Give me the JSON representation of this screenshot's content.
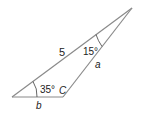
{
  "diagram": {
    "type": "triangle",
    "vertices": {
      "A": {
        "x": 12,
        "y": 97
      },
      "C": {
        "x": 63,
        "y": 97
      },
      "B": {
        "x": 132,
        "y": 8
      }
    },
    "labels": {
      "side_hyp": "5",
      "angle_top": "15°",
      "side_a": "a",
      "angle_left": "35°",
      "vertex_c": "C",
      "side_b": "b"
    },
    "colors": {
      "line": "#8a8a8a",
      "text": "#222222"
    }
  }
}
